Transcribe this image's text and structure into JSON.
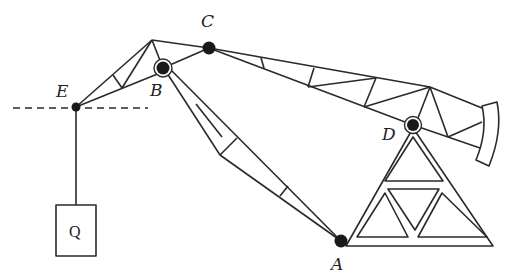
{
  "diagram": {
    "type": "mechanical structure / pumpjack-like truss crane",
    "colors": {
      "line": "#2a2a2a",
      "background": "#ffffff",
      "joint": "#1a1a1a"
    },
    "points": {
      "A": {
        "label": "A",
        "x": 341,
        "y": 241
      },
      "B": {
        "label": "B",
        "x": 163,
        "y": 68
      },
      "C": {
        "label": "C",
        "x": 209,
        "y": 48
      },
      "D": {
        "label": "D",
        "x": 413,
        "y": 125
      },
      "E": {
        "label": "E",
        "x": 76,
        "y": 107
      }
    },
    "load": {
      "label": "Q"
    }
  }
}
